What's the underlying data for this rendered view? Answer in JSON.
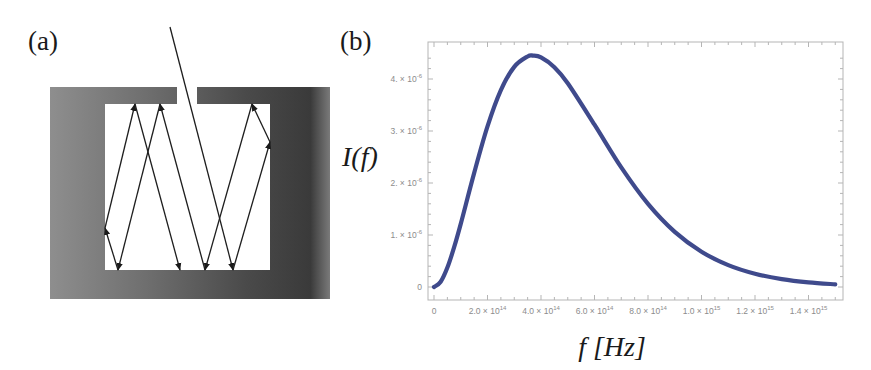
{
  "panels": {
    "a": {
      "label": "(a)",
      "description": "Cavity with small opening; incoming ray reflected repeatedly inside",
      "arrowheads": "bounce-direction"
    },
    "b": {
      "label": "(b)"
    }
  },
  "colors": {
    "curve": "#3f4a8c",
    "frame": "#b5b5b5",
    "tick_text": "#8c8c8c",
    "cavity_light": "#8e8e8e",
    "cavity_dark": "#3a3a3a"
  },
  "chart_data": {
    "type": "line",
    "title": "",
    "xlabel": "f [Hz]",
    "ylabel": "I(f)",
    "xlim": [
      0,
      1520000000000000.0
    ],
    "ylim": [
      0,
      4.6e-06
    ],
    "grid": false,
    "legend": "none",
    "x_ticks": [
      {
        "value": 0,
        "label": "0"
      },
      {
        "value": 200000000000000.0,
        "label": "2.0 × 10",
        "exp": "14"
      },
      {
        "value": 400000000000000.0,
        "label": "4.0 × 10",
        "exp": "14"
      },
      {
        "value": 600000000000000.0,
        "label": "6.0 × 10",
        "exp": "14"
      },
      {
        "value": 800000000000000.0,
        "label": "8.0 × 10",
        "exp": "14"
      },
      {
        "value": 1000000000000000.0,
        "label": "1.0 × 10",
        "exp": "15"
      },
      {
        "value": 1200000000000000.0,
        "label": "1.2 × 10",
        "exp": "15"
      },
      {
        "value": 1400000000000000.0,
        "label": "1.4 × 10",
        "exp": "15"
      }
    ],
    "y_ticks": [
      {
        "value": 0,
        "label": "0"
      },
      {
        "value": 1e-06,
        "label": "1. × 10",
        "exp": "-6"
      },
      {
        "value": 2e-06,
        "label": "2. × 10",
        "exp": "-6"
      },
      {
        "value": 3e-06,
        "label": "3. × 10",
        "exp": "-6"
      },
      {
        "value": 4e-06,
        "label": "4. × 10",
        "exp": "-6"
      }
    ],
    "series": [
      {
        "name": "I(f)",
        "x": [
          0,
          25000000000000.0,
          50000000000000.0,
          75000000000000.0,
          100000000000000.0,
          150000000000000.0,
          200000000000000.0,
          250000000000000.0,
          300000000000000.0,
          350000000000000.0,
          370000000000000.0,
          400000000000000.0,
          450000000000000.0,
          500000000000000.0,
          600000000000000.0,
          700000000000000.0,
          800000000000000.0,
          900000000000000.0,
          1000000000000000.0,
          1100000000000000.0,
          1200000000000000.0,
          1300000000000000.0,
          1400000000000000.0,
          1500000000000000.0
        ],
        "y": [
          0,
          1e-07,
          3.73e-07,
          7.6e-07,
          1.213e-06,
          2.19e-06,
          3.088e-06,
          3.786e-06,
          4.234e-06,
          4.434e-06,
          4.45e-06,
          4.416e-06,
          4.228e-06,
          3.919e-06,
          3.122e-06,
          2.3e-06,
          1.598e-06,
          1.06e-06,
          6.78e-07,
          4.21e-07,
          2.55e-07,
          1.51e-07,
          8.8e-08,
          5.1e-08
        ]
      }
    ]
  }
}
